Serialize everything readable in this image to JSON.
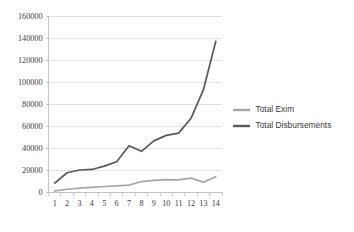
{
  "chart_data": {
    "type": "line",
    "title": "",
    "xlabel": "",
    "ylabel": "",
    "categories": [
      "1",
      "2",
      "3",
      "4",
      "5",
      "6",
      "7",
      "8",
      "9",
      "10",
      "11",
      "12",
      "13",
      "14"
    ],
    "ylim": [
      0,
      160000
    ],
    "ytick_labels": [
      "160000",
      "140000",
      "120000",
      "100000",
      "80000",
      "60000",
      "40000",
      "20000",
      "0"
    ],
    "ytick_values": [
      160000,
      140000,
      120000,
      100000,
      80000,
      60000,
      40000,
      20000,
      0
    ],
    "grid": true,
    "grid_color": "#d9d9d9",
    "legend_position": "right",
    "plot_background": "#ffffff",
    "series": [
      {
        "name": "Total Exim",
        "color": "#a6a6a6",
        "values": [
          1000,
          2500,
          3500,
          4200,
          5000,
          5600,
          6200,
          9500,
          10500,
          11200,
          11000,
          12600,
          9000,
          13800
        ]
      },
      {
        "name": "Total Disbursements",
        "color": "#595959",
        "values": [
          8000,
          17500,
          20000,
          20500,
          23500,
          27500,
          42000,
          37000,
          46500,
          51500,
          53500,
          67000,
          93000,
          137000
        ]
      }
    ]
  },
  "legend": {
    "entries": [
      {
        "label": "Total Exim"
      },
      {
        "label": "Total Disbursements"
      }
    ]
  },
  "axis": {
    "axis_color": "#bfbfbf",
    "tick_color": "#bfbfbf"
  }
}
